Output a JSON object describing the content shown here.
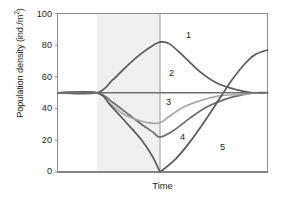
{
  "chart_data": {
    "type": "line",
    "title": "",
    "xlabel": "Time",
    "ylabel": "Population density (ind./m²)",
    "ylabel_main": "Population density (ind./m",
    "ylabel_sup": "2",
    "ylabel_close": ")",
    "ylim": [
      0,
      100
    ],
    "yticks": [
      0,
      20,
      40,
      60,
      80,
      100
    ],
    "ytick_labels": [
      "0",
      "20",
      "40",
      "60",
      "80",
      "100"
    ],
    "xticks": [],
    "xtick_labels": [],
    "grid": false,
    "legend": "inline-curve-numbers",
    "baseline_value": 50,
    "shaded_band": {
      "label": "disturbance period",
      "x_start_frac": 0.185,
      "x_end_frac": 0.487,
      "color": "#f0f0f0"
    },
    "divergence_point": {
      "x_frac": 0.185,
      "y": 50
    },
    "series": [
      {
        "name": "1",
        "label": "1",
        "color": "#595959",
        "points": [
          [
            0.0,
            50
          ],
          [
            0.185,
            50
          ],
          [
            0.26,
            58
          ],
          [
            0.33,
            67
          ],
          [
            0.4,
            75
          ],
          [
            0.455,
            80
          ],
          [
            0.487,
            82
          ],
          [
            0.53,
            81
          ],
          [
            0.6,
            73
          ],
          [
            0.68,
            63
          ],
          [
            0.76,
            56
          ],
          [
            0.85,
            52
          ],
          [
            0.93,
            50
          ],
          [
            1.0,
            50
          ]
        ]
      },
      {
        "name": "2",
        "label": "2",
        "color": "#6b6b6b",
        "points": [
          [
            0.0,
            50
          ],
          [
            0.185,
            50
          ],
          [
            0.26,
            44
          ],
          [
            0.33,
            37
          ],
          [
            0.4,
            30
          ],
          [
            0.455,
            25
          ],
          [
            0.487,
            22
          ],
          [
            0.55,
            26
          ],
          [
            0.63,
            34
          ],
          [
            0.71,
            41
          ],
          [
            0.8,
            46
          ],
          [
            0.89,
            49
          ],
          [
            0.95,
            50
          ],
          [
            1.0,
            50
          ]
        ]
      },
      {
        "name": "3",
        "label": "3",
        "color": "#a8a8a8",
        "points": [
          [
            0.0,
            50
          ],
          [
            0.185,
            50
          ],
          [
            0.25,
            43
          ],
          [
            0.32,
            36
          ],
          [
            0.4,
            32
          ],
          [
            0.44,
            31
          ],
          [
            0.487,
            31
          ],
          [
            0.53,
            35
          ],
          [
            0.6,
            41
          ],
          [
            0.68,
            45
          ],
          [
            0.77,
            48
          ],
          [
            0.87,
            49
          ],
          [
            0.95,
            50
          ],
          [
            1.0,
            50
          ]
        ]
      },
      {
        "name": "4",
        "label": "4",
        "color": "#595959",
        "points": [
          [
            0.0,
            50
          ],
          [
            0.185,
            50
          ],
          [
            0.25,
            42
          ],
          [
            0.32,
            32
          ],
          [
            0.4,
            20
          ],
          [
            0.45,
            10
          ],
          [
            0.487,
            0
          ]
        ]
      },
      {
        "name": "5",
        "label": "5",
        "color": "#595959",
        "points": [
          [
            0.487,
            0
          ],
          [
            0.56,
            8
          ],
          [
            0.63,
            19
          ],
          [
            0.7,
            32
          ],
          [
            0.77,
            46
          ],
          [
            0.83,
            58
          ],
          [
            0.89,
            68
          ],
          [
            0.94,
            74
          ],
          [
            1.0,
            77
          ]
        ]
      },
      {
        "name": "baseline",
        "label": "",
        "color": "#707070",
        "points": [
          [
            0.0,
            50
          ],
          [
            1.0,
            50
          ]
        ]
      },
      {
        "name": "zero-line",
        "label": "",
        "color": "#707070",
        "points": [
          [
            0.0,
            0
          ],
          [
            1.0,
            0
          ]
        ]
      }
    ],
    "curve_labels": [
      {
        "text": "1",
        "x": 186,
        "y": 30
      },
      {
        "text": "2",
        "x": 169,
        "y": 68
      },
      {
        "text": "3",
        "x": 166,
        "y": 97
      },
      {
        "text": "4",
        "x": 180,
        "y": 132
      },
      {
        "text": "5",
        "x": 220,
        "y": 142
      }
    ],
    "axis_color": "#8c8c8c",
    "background": "#ffffff"
  }
}
